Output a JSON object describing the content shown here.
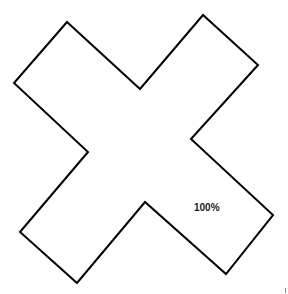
{
  "shape": {
    "type": "x-cross-outline",
    "stroke_color": "#000000",
    "fill_color": "#ffffff",
    "points": [
      [
        67,
        22
      ],
      [
        140,
        89
      ],
      [
        203,
        15
      ],
      [
        258,
        65
      ],
      [
        191,
        139
      ],
      [
        273,
        215
      ],
      [
        226,
        274
      ],
      [
        145,
        202
      ],
      [
        77,
        283
      ],
      [
        20,
        232
      ],
      [
        88,
        152
      ],
      [
        14,
        83
      ]
    ]
  },
  "zoom_label": "100%"
}
